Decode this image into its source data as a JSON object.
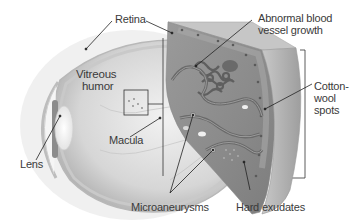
{
  "diagram": {
    "labels": {
      "retina": "Retina",
      "vitreous_humor_line1": "Vitreous",
      "vitreous_humor_line2": "humor",
      "lens": "Lens",
      "macula": "Macula",
      "abnormal_vessel_line1": "Abnormal blood",
      "abnormal_vessel_line2": "vessel growth",
      "cotton_wool_line1": "Cotton-",
      "cotton_wool_line2": "wool",
      "cotton_wool_line3": "spots",
      "microaneurysms": "Microaneurysms",
      "hard_exudates": "Hard exudates"
    },
    "colors": {
      "background": "#ffffff",
      "eye_fill": "#d9d9d9",
      "eye_shadow": "#a8a8a8",
      "retina_fill": "#8e8e8e",
      "retina_edge": "#b5b5b5",
      "vessel": "#6a6a6a",
      "leader_line": "#222222",
      "label_text": "#3a3a3a"
    }
  }
}
